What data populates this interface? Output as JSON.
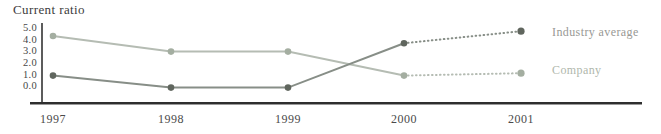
{
  "chart_data": {
    "type": "line",
    "title": "Current ratio",
    "x": [
      "1997",
      "1998",
      "1999",
      "2000",
      "2001"
    ],
    "y_ticks": [
      "5.0",
      "4.0",
      "3.0",
      "2.0",
      "1.0",
      "0.0"
    ],
    "ylim": [
      0,
      5
    ],
    "grid": false,
    "legend_position": "right",
    "projection_style": "dotted-from-2000-to-2001",
    "series": [
      {
        "name": "Industry average",
        "values": [
          1.2,
          0.2,
          0.2,
          3.9,
          4.9
        ],
        "solid_until_index": 3,
        "color": "#878e87",
        "marker_color": "#60665e",
        "label_color": "#989894"
      },
      {
        "name": "Company",
        "values": [
          4.5,
          3.2,
          3.2,
          1.2,
          1.4
        ],
        "solid_until_index": 3,
        "color": "#b5bcb3",
        "marker_color": "#a4aea1",
        "label_color": "#b0b7ac"
      }
    ]
  }
}
